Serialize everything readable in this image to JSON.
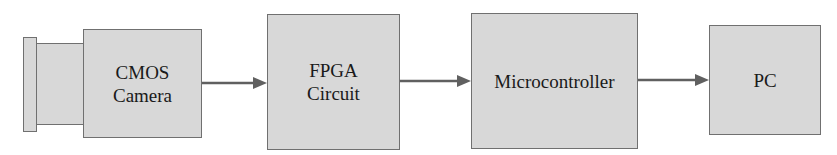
{
  "diagram": {
    "type": "block-flow",
    "direction": "left-to-right",
    "colors": {
      "block_fill": "#d8d8d8",
      "block_border": "#707070",
      "arrow": "#606060",
      "text": "#1a1a1a"
    },
    "blocks": [
      {
        "id": "cmos",
        "line1": "CMOS",
        "line2": "Camera",
        "has_lens": true
      },
      {
        "id": "fpga",
        "line1": "FPGA",
        "line2": "Circuit"
      },
      {
        "id": "mcu",
        "line1": "Microcontroller"
      },
      {
        "id": "pc",
        "line1": "PC"
      }
    ],
    "edges": [
      {
        "from": "cmos",
        "to": "fpga"
      },
      {
        "from": "fpga",
        "to": "mcu"
      },
      {
        "from": "mcu",
        "to": "pc"
      }
    ]
  }
}
